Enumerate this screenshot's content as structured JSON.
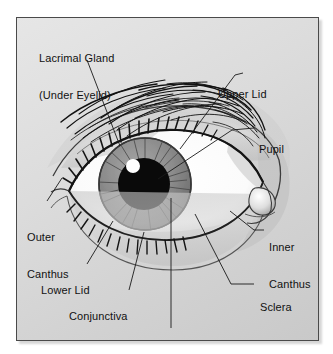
{
  "figure": {
    "panel_background_color": "#dcdcdc",
    "panel_border_color": "#4a4a4a",
    "label_text_color": "#111111",
    "leader_line_color": "#1a1a1a",
    "page_background_color": "#ffffff"
  },
  "labels": [
    {
      "id": "lacrimal-gland",
      "line1": "Lacrimal Gland",
      "line2": "(Under Eyelid)"
    },
    {
      "id": "upper-lid",
      "line1": "Upper Lid",
      "line2": ""
    },
    {
      "id": "pupil",
      "line1": "Pupil",
      "line2": ""
    },
    {
      "id": "inner-canthus",
      "line1": "Inner",
      "line2": "Canthus"
    },
    {
      "id": "sclera",
      "line1": "Sclera",
      "line2": ""
    },
    {
      "id": "outer-canthus",
      "line1": "Outer",
      "line2": "Canthus"
    },
    {
      "id": "lower-lid",
      "line1": "Lower Lid",
      "line2": ""
    },
    {
      "id": "conjunctiva",
      "line1": "Conjunctiva",
      "line2": ""
    },
    {
      "id": "iris",
      "line1": "Iris",
      "line2": ""
    }
  ],
  "illustration": {
    "name": "human-eye-anterior-view",
    "parts": [
      "eyebrow",
      "upper-lid",
      "upper-lashes",
      "lower-lid",
      "lower-lashes",
      "sclera",
      "iris",
      "pupil",
      "catchlight",
      "caruncle",
      "inner-canthus",
      "outer-canthus"
    ],
    "iris_color": "#8b8b8b",
    "pupil_color": "#0a0a0a",
    "sclera_color": "#ffffff",
    "catchlight_color": "#ffffff"
  }
}
